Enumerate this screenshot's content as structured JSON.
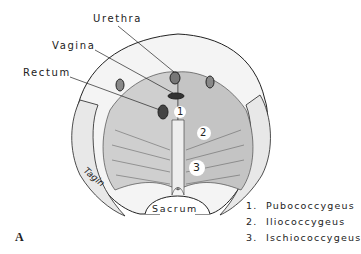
{
  "figure": {
    "panel_label": "A",
    "labels": {
      "urethra": "Urethra",
      "vagina": "Vagina",
      "rectum": "Rectum",
      "sacrum": "Sacrum",
      "signature": "Tagin"
    },
    "muscle_numbers": [
      "1",
      "2",
      "3"
    ],
    "legend": [
      {
        "number": "1.",
        "name": "Pubococcygeus"
      },
      {
        "number": "2.",
        "name": "Iliococcygeus"
      },
      {
        "number": "3.",
        "name": "Ischiococcygeus"
      }
    ]
  }
}
